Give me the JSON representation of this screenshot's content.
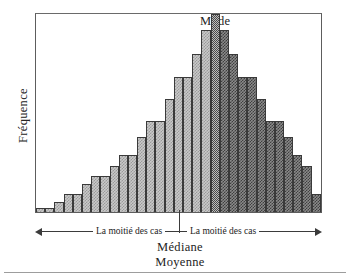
{
  "figure": {
    "y_axis_label": "Fréquence",
    "mode_label": "Mode",
    "left_half_label": "La moitié des cas",
    "right_half_label": "La moitié des cas",
    "median_label": "Médiane",
    "mean_label": "Moyenne"
  },
  "colors": {
    "light_fill": "#c9c9c9",
    "light_dither": "#9a9a9a",
    "dark_fill": "#8a8a8a",
    "dark_dither": "#3f3f3f",
    "outline": "#3a3a3a",
    "frame": "#5d5d5d",
    "text": "#232323"
  },
  "chart_data": {
    "type": "bar",
    "title": "",
    "subtitle": "",
    "xlabel": "",
    "ylabel": "Fréquence",
    "grid": false,
    "legend": "none",
    "xlim": [
      0,
      31
    ],
    "ylim": [
      0,
      100
    ],
    "annotations": [
      {
        "text": "Mode",
        "position": "top-center",
        "points_to": "tallest-bar"
      },
      {
        "text": "La moitié des cas",
        "position": "below-axis-left"
      },
      {
        "text": "La moitié des cas",
        "position": "below-axis-right"
      },
      {
        "text": "Médiane",
        "position": "below-axis-center"
      },
      {
        "text": "Moyenne",
        "position": "below-axis-center"
      }
    ],
    "categories": [
      "1",
      "2",
      "3",
      "4",
      "5",
      "6",
      "7",
      "8",
      "9",
      "10",
      "11",
      "12",
      "13",
      "14",
      "15",
      "16",
      "17",
      "18",
      "19",
      "20",
      "21",
      "22",
      "23",
      "24",
      "25",
      "26",
      "27",
      "28",
      "29",
      "30",
      "31"
    ],
    "values": [
      2,
      2,
      5,
      9,
      9,
      14,
      18,
      18,
      23,
      29,
      29,
      38,
      46,
      46,
      57,
      68,
      68,
      80,
      92,
      100,
      92,
      80,
      68,
      68,
      57,
      46,
      46,
      38,
      29,
      23,
      9
    ],
    "bar_groups": [
      {
        "name": "La moitié des cas (gauche)",
        "fill": "#c9c9c9",
        "bar_indices": [
          0,
          1,
          2,
          3,
          4,
          5,
          6,
          7,
          8,
          9,
          10,
          11,
          12,
          13,
          14,
          15,
          16,
          17,
          18
        ]
      },
      {
        "name": "Mode",
        "fill": "#bdbdbd",
        "bar_indices": [
          19
        ]
      },
      {
        "name": "La moitié des cas (droite)",
        "fill": "#8a8a8a",
        "bar_indices": [
          20,
          21,
          22,
          23,
          24,
          25,
          26,
          27,
          28,
          29,
          30
        ]
      }
    ]
  }
}
